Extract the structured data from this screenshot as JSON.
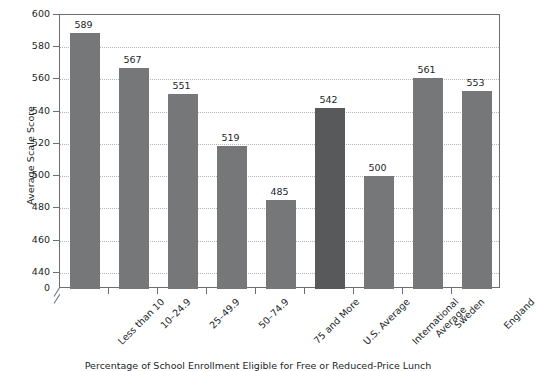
{
  "chart_data": {
    "type": "bar",
    "title": "",
    "xlabel": "Percentage of School Enrollment Eligible for Free or Reduced-Price Lunch",
    "ylabel": "Average Scale Score",
    "categories": [
      "Less than 10",
      "10–24.9",
      "25–49.9",
      "50–74.9",
      "75 and More",
      "U.S. Average",
      "International Average",
      "Sweden",
      "England"
    ],
    "values": [
      589,
      567,
      551,
      519,
      485,
      542,
      500,
      561,
      553
    ],
    "ylim": [
      430,
      600
    ],
    "yticks": [
      600,
      580,
      560,
      540,
      520,
      500,
      480,
      460,
      440,
      0
    ],
    "ytick_labels": [
      "600",
      "580",
      "560",
      "540",
      "520",
      "500",
      "480",
      "460",
      "440",
      "0"
    ],
    "axis_break": true,
    "grid": true,
    "grid_axis": "y",
    "legend": "none",
    "bar_color": "#757779",
    "highlight_color": "#58595b",
    "highlighted_categories": [
      "U.S. Average"
    ]
  },
  "axis": {
    "y_title": "Average Scale Score",
    "x_title": "Percentage of School Enrollment Eligible for Free or Reduced-Price Lunch"
  },
  "categories_display": [
    {
      "line1": "Less than 10",
      "line2": ""
    },
    {
      "line1": "10–24.9",
      "line2": ""
    },
    {
      "line1": "25–49.9",
      "line2": ""
    },
    {
      "line1": "50–74.9",
      "line2": ""
    },
    {
      "line1": "75 and More",
      "line2": ""
    },
    {
      "line1": "U.S. Average",
      "line2": ""
    },
    {
      "line1": "International",
      "line2": "Average"
    },
    {
      "line1": "Sweden",
      "line2": ""
    },
    {
      "line1": "England",
      "line2": ""
    }
  ],
  "values_display": [
    "589",
    "567",
    "551",
    "519",
    "485",
    "542",
    "500",
    "561",
    "553"
  ]
}
